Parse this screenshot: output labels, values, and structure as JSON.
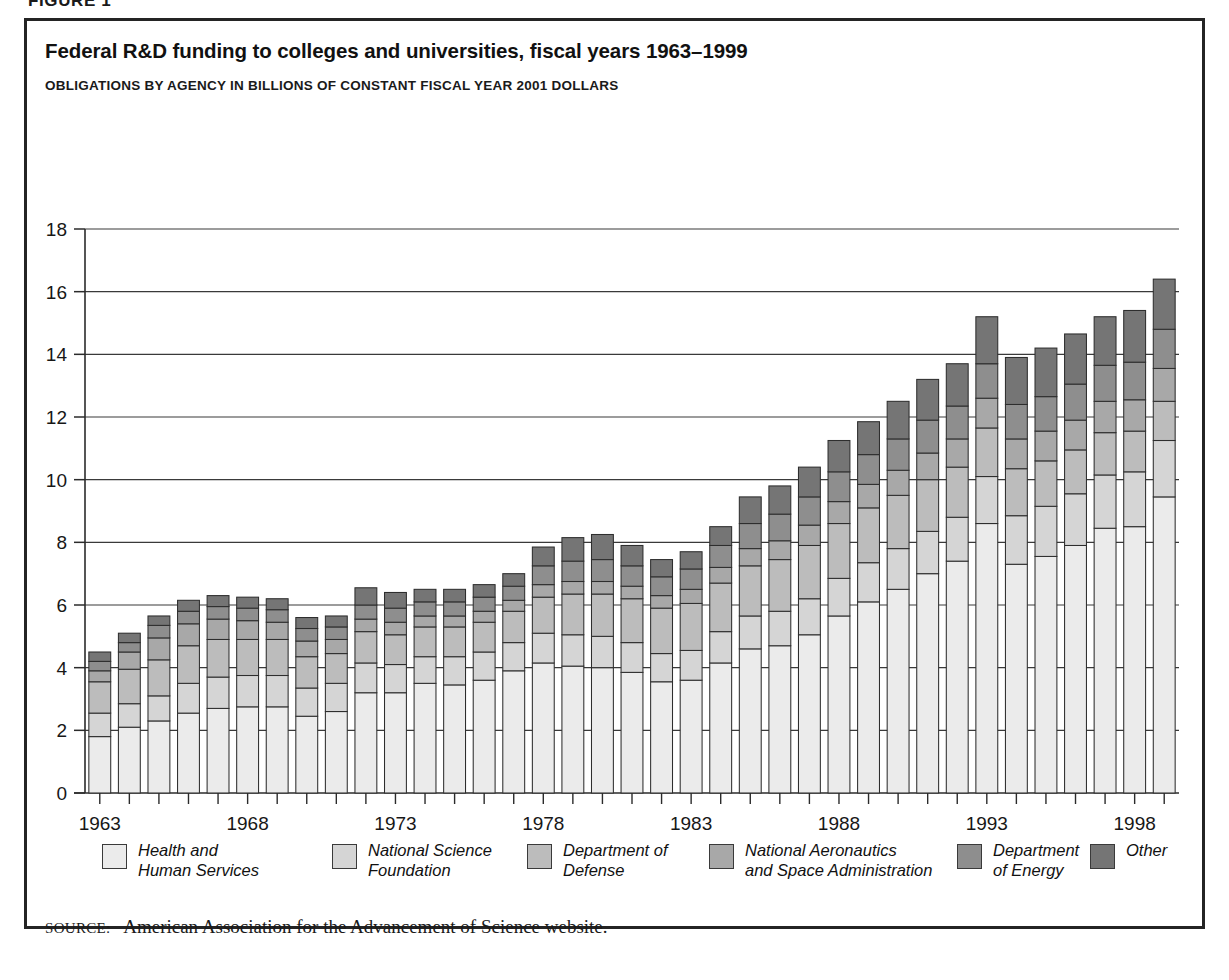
{
  "figure_caption": "FIGURE 1",
  "title": "Federal R&D funding to colleges and universities, fiscal years 1963–1999",
  "subtitle": "OBLIGATIONS BY AGENCY IN BILLIONS OF CONSTANT FISCAL YEAR 2001 DOLLARS",
  "source": {
    "prefix": "SOURCE:",
    "text": "American Association for the Advancement of Science website."
  },
  "colors": {
    "hhs": "#ebebeb",
    "nsf": "#d5d5d5",
    "dod": "#bcbcbc",
    "nasa": "#a8a8a8",
    "doe": "#8e8e8e",
    "other": "#757575",
    "outline": "#2e2e2e",
    "axis": "#2b2b2b",
    "frame": "#242424"
  },
  "legend": [
    {
      "key": "hhs",
      "label": "Health and\nHuman Services",
      "color": "#ebebeb"
    },
    {
      "key": "nsf",
      "label": "National Science\nFoundation",
      "color": "#d5d5d5"
    },
    {
      "key": "dod",
      "label": "Department of\nDefense",
      "color": "#bcbcbc"
    },
    {
      "key": "nasa",
      "label": "National Aeronautics\nand Space Administration",
      "color": "#a8a8a8"
    },
    {
      "key": "doe",
      "label": "Department\nof Energy",
      "color": "#8e8e8e"
    },
    {
      "key": "other",
      "label": "Other",
      "color": "#757575"
    }
  ],
  "chart_data": {
    "type": "bar",
    "stacked": true,
    "title": "Federal R&D funding to colleges and universities, fiscal years 1963–1999",
    "subtitle": "OBLIGATIONS BY AGENCY IN BILLIONS OF CONSTANT FISCAL YEAR 2001 DOLLARS",
    "xlabel": "",
    "ylabel": "",
    "ylim": [
      0,
      18
    ],
    "yticks": [
      0,
      2,
      4,
      6,
      8,
      10,
      12,
      14,
      16,
      18
    ],
    "grid": true,
    "legend_position": "bottom",
    "categories": [
      1963,
      1964,
      1965,
      1966,
      1967,
      1968,
      1969,
      1970,
      1971,
      1972,
      1973,
      1974,
      1975,
      1976,
      1977,
      1978,
      1979,
      1980,
      1981,
      1982,
      1983,
      1984,
      1985,
      1986,
      1987,
      1988,
      1989,
      1990,
      1991,
      1992,
      1993,
      1994,
      1995,
      1996,
      1997,
      1998,
      1999
    ],
    "xtick_labels": [
      1963,
      1968,
      1973,
      1978,
      1983,
      1988,
      1993,
      1998
    ],
    "series": [
      {
        "name": "Health and Human Services",
        "key": "hhs",
        "color": "#ebebeb",
        "values": [
          1.8,
          2.1,
          2.3,
          2.55,
          2.7,
          2.75,
          2.75,
          2.45,
          2.6,
          3.2,
          3.2,
          3.5,
          3.45,
          3.6,
          3.9,
          4.15,
          4.05,
          4.0,
          3.85,
          3.55,
          3.6,
          4.15,
          4.6,
          4.7,
          5.05,
          5.65,
          6.1,
          6.5,
          7.0,
          7.4,
          8.6,
          7.3,
          7.55,
          7.9,
          8.45,
          8.5,
          9.45
        ]
      },
      {
        "name": "National Science Foundation",
        "key": "nsf",
        "color": "#d5d5d5",
        "values": [
          0.75,
          0.75,
          0.8,
          0.95,
          1.0,
          1.0,
          1.0,
          0.9,
          0.9,
          0.95,
          0.9,
          0.85,
          0.9,
          0.9,
          0.9,
          0.95,
          1.0,
          1.0,
          0.95,
          0.9,
          0.95,
          1.0,
          1.05,
          1.1,
          1.15,
          1.2,
          1.25,
          1.3,
          1.35,
          1.4,
          1.5,
          1.55,
          1.6,
          1.65,
          1.7,
          1.75,
          1.8
        ]
      },
      {
        "name": "Department of Defense",
        "key": "dod",
        "color": "#bcbcbc",
        "values": [
          1.0,
          1.1,
          1.15,
          1.2,
          1.2,
          1.15,
          1.15,
          1.0,
          0.95,
          1.0,
          0.95,
          0.95,
          0.95,
          0.95,
          1.0,
          1.15,
          1.3,
          1.35,
          1.4,
          1.45,
          1.5,
          1.55,
          1.6,
          1.65,
          1.7,
          1.75,
          1.75,
          1.7,
          1.65,
          1.6,
          1.55,
          1.5,
          1.45,
          1.4,
          1.35,
          1.3,
          1.25
        ]
      },
      {
        "name": "National Aeronautics and Space Administration",
        "key": "nasa",
        "color": "#a8a8a8",
        "values": [
          0.35,
          0.55,
          0.7,
          0.7,
          0.65,
          0.6,
          0.55,
          0.5,
          0.45,
          0.4,
          0.4,
          0.35,
          0.35,
          0.35,
          0.35,
          0.4,
          0.4,
          0.4,
          0.4,
          0.4,
          0.45,
          0.5,
          0.55,
          0.6,
          0.65,
          0.7,
          0.75,
          0.8,
          0.85,
          0.9,
          0.95,
          0.95,
          0.95,
          0.95,
          1.0,
          1.0,
          1.05
        ]
      },
      {
        "name": "Department of Energy",
        "key": "doe",
        "color": "#8e8e8e",
        "values": [
          0.3,
          0.3,
          0.4,
          0.4,
          0.4,
          0.4,
          0.4,
          0.4,
          0.4,
          0.45,
          0.45,
          0.45,
          0.45,
          0.45,
          0.45,
          0.6,
          0.65,
          0.7,
          0.65,
          0.6,
          0.65,
          0.7,
          0.8,
          0.85,
          0.9,
          0.95,
          0.95,
          1.0,
          1.05,
          1.05,
          1.1,
          1.1,
          1.1,
          1.15,
          1.15,
          1.2,
          1.25
        ]
      },
      {
        "name": "Other",
        "key": "other",
        "color": "#757575",
        "values": [
          0.3,
          0.3,
          0.3,
          0.35,
          0.35,
          0.35,
          0.35,
          0.35,
          0.35,
          0.55,
          0.5,
          0.4,
          0.4,
          0.4,
          0.4,
          0.6,
          0.75,
          0.8,
          0.65,
          0.55,
          0.55,
          0.6,
          0.85,
          0.9,
          0.95,
          1.0,
          1.05,
          1.2,
          1.3,
          1.35,
          1.5,
          1.5,
          1.55,
          1.6,
          1.55,
          1.65,
          1.6
        ]
      }
    ]
  }
}
